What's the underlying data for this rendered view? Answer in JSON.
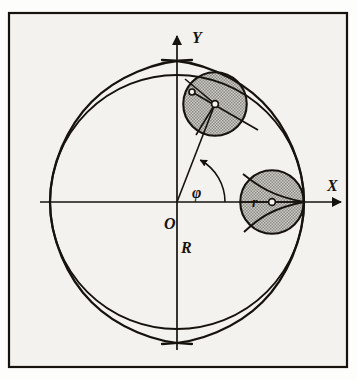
{
  "figure": {
    "kind": "geometry-diagram",
    "background_color": "#f4f2ee",
    "page_color": "#fdfdfb",
    "ink_color": "#16130f",
    "shade_color": "#b9b7b2",
    "frame": {
      "x": 8,
      "y": 12,
      "width": 340,
      "height": 356,
      "stroke_width": 2.2
    },
    "axes": {
      "origin": {
        "x": 177,
        "y": 202
      },
      "x_axis": {
        "label": "X",
        "label_x": 327,
        "label_y": 191,
        "start_x": 40,
        "end_x": 345,
        "arrow": "right"
      },
      "y_axis": {
        "label": "Y",
        "label_x": 192,
        "label_y": 43,
        "start_y": 350,
        "end_y": 33,
        "arrow": "up"
      }
    },
    "labels": {
      "origin": {
        "text": "O",
        "x": 168,
        "y": 228
      },
      "big_radius": {
        "text": "R",
        "x": 185,
        "y": 252
      },
      "angle": {
        "text": "φ",
        "x": 197,
        "y": 197
      },
      "small_radius": {
        "text": "r",
        "x": 256,
        "y": 207
      }
    },
    "big_circle": {
      "name": "R",
      "center_x": 177,
      "center_y": 202,
      "radius": 127,
      "stroke_width": 1.9
    },
    "astroid": {
      "name": "hypocycloid-astroid",
      "cusps": [
        "+X",
        "+Y",
        "-X",
        "-Y"
      ],
      "radius": 127,
      "stroke_width": 2.3
    },
    "rolling_circles": [
      {
        "name": "rolling-circle-phi",
        "angle_deg": 61,
        "center_x": 215,
        "center_y": 104,
        "radius": 31.75,
        "shaded": true,
        "contact_point_x": 192,
        "contact_point_y": 92
      },
      {
        "name": "rolling-circle-zero",
        "angle_deg": 0,
        "center_x": 272,
        "center_y": 202,
        "radius": 31.75,
        "shaded": true,
        "contact_point_x": 304,
        "contact_point_y": 202
      }
    ],
    "angle_arc": {
      "name": "phi-arc",
      "radius": 48,
      "start_deg": 0,
      "end_deg": 61,
      "arrow": "ccw"
    }
  }
}
